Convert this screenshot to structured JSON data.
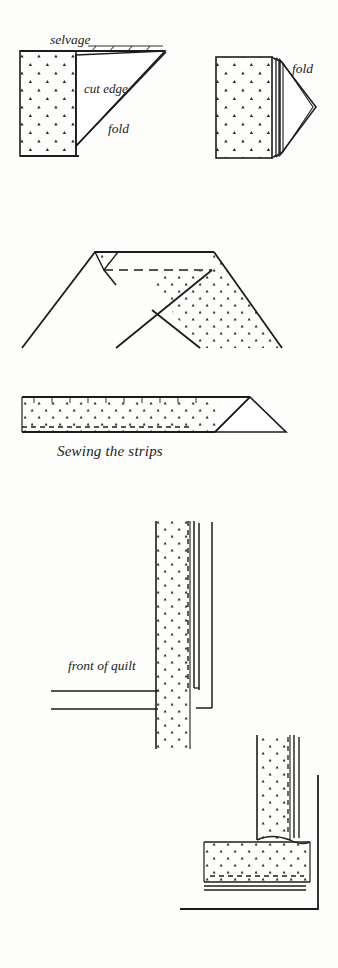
{
  "page": {
    "background_color": "#fdfdfb",
    "ink_color": "#1c1c1c",
    "width": 338,
    "height": 968
  },
  "figures": [
    {
      "id": "fig-fold-step1",
      "caption": "",
      "labels": [
        {
          "name": "selvage",
          "text": "selvage"
        },
        {
          "name": "cut-edge",
          "text": "cut edge"
        },
        {
          "name": "fold",
          "text": "fold"
        }
      ]
    },
    {
      "id": "fig-fold-step2",
      "caption": "",
      "labels": [
        {
          "name": "fold",
          "text": "fold"
        }
      ]
    },
    {
      "id": "fig-joining-strips",
      "caption": "",
      "labels": []
    },
    {
      "id": "fig-sewn-strip",
      "caption": "Sewing the strips",
      "labels": []
    },
    {
      "id": "fig-binding-on-quilt",
      "caption": "",
      "labels": [
        {
          "name": "front-of-quilt",
          "text": "front of quilt"
        }
      ]
    },
    {
      "id": "fig-mitered-corner",
      "caption": "",
      "labels": []
    }
  ],
  "labels": {
    "selvage": "selvage",
    "cut_edge": "cut edge",
    "fold_left": "fold",
    "fold_right": "fold",
    "sewing_the_strips": "Sewing the strips",
    "front_of_quilt": "front of quilt"
  }
}
